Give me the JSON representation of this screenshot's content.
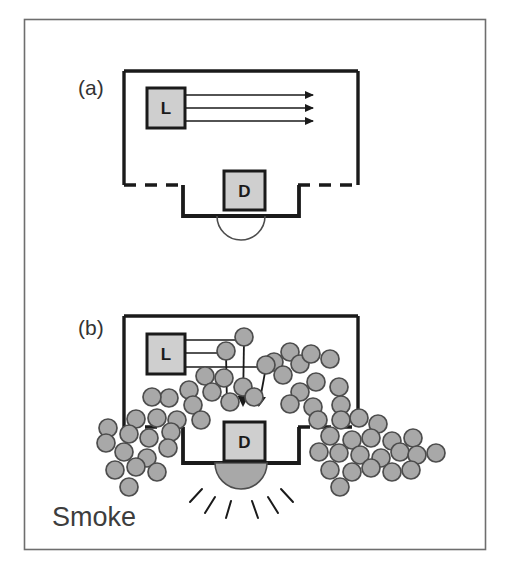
{
  "figure": {
    "caption_panels": [
      {
        "id": "a",
        "label": "(a)",
        "x": 78,
        "y": 88
      },
      {
        "id": "b",
        "label": "(b)",
        "x": 78,
        "y": 328
      }
    ],
    "annotations": {
      "smoke_label": "Smoke",
      "smoke_label_x": 52,
      "smoke_label_y": 526
    },
    "colors": {
      "frame_stroke": "#6e6e6e",
      "chamber_stroke": "#1a1a1a",
      "box_fill": "#cfcfcf",
      "box_stroke": "#1a1a1a",
      "particle_fill": "#a8a8a8",
      "particle_stroke": "#4d4d4d",
      "beam_stroke": "#1a1a1a",
      "dome_fill": "#a8a8a8",
      "dome_stroke": "#1a1a1a",
      "ray_stroke": "#1a1a1a",
      "background": "#ffffff",
      "text": "#333333"
    },
    "outer_frame": {
      "x": 24,
      "y": 19,
      "width": 461,
      "height": 530
    },
    "panel_a": {
      "chamber": {
        "solid_top": "M 124 71 L 358 71",
        "left_wall": "M 124 71 L 124 185",
        "right_wall": "M 358 71 L 358 185",
        "dashed_left": "M 124 185 L 182 185",
        "dashed_right": "M 300 185 L 358 185",
        "well": "M 182 185 L 182 216 L 300 216 L 300 185"
      },
      "source_box": {
        "x": 147,
        "y": 88,
        "width": 38,
        "height": 40,
        "letter": "L"
      },
      "detector_box": {
        "x": 224,
        "y": 171,
        "width": 41,
        "height": 39,
        "letter": "D"
      },
      "dome": {
        "cx": 241,
        "cy": 216,
        "r": 24,
        "filled": false
      },
      "beams": [
        {
          "x1": 186,
          "y1": 95,
          "x2": 313,
          "y2": 95
        },
        {
          "x1": 186,
          "y1": 108,
          "x2": 313,
          "y2": 108
        },
        {
          "x1": 186,
          "y1": 121,
          "x2": 313,
          "y2": 121
        }
      ]
    },
    "panel_b": {
      "chamber": {
        "solid_top": "M 124 316 L 358 316",
        "left_wall": "M 124 316 L 124 427",
        "right_wall": "M 358 316 L 358 427",
        "dashed_left": "M 124 427 L 182 427",
        "dashed_right": "M 300 427 L 358 427",
        "well": "M 182 427 L 182 463 L 300 463 L 300 427"
      },
      "source_box": {
        "x": 147,
        "y": 334,
        "width": 38,
        "height": 40,
        "letter": "L"
      },
      "detector_box": {
        "x": 224,
        "y": 422,
        "width": 41,
        "height": 39,
        "letter": "D"
      },
      "dome": {
        "cx": 241,
        "cy": 463,
        "r": 26,
        "filled": true
      },
      "alarm_rays": [
        {
          "x1": 202,
          "y1": 489,
          "x2": 190,
          "y2": 502
        },
        {
          "x1": 215,
          "y1": 497,
          "x2": 205,
          "y2": 513
        },
        {
          "x1": 231,
          "y1": 501,
          "x2": 226,
          "y2": 518
        },
        {
          "x1": 252,
          "y1": 501,
          "x2": 258,
          "y2": 518
        },
        {
          "x1": 268,
          "y1": 497,
          "x2": 278,
          "y2": 513
        },
        {
          "x1": 281,
          "y1": 489,
          "x2": 293,
          "y2": 502
        }
      ],
      "scatter_paths": [
        {
          "from_x": 186,
          "from_y": 340,
          "hit_x": 244,
          "hit_y": 340,
          "to_x": 243,
          "to_y": 412
        },
        {
          "from_x": 186,
          "from_y": 353,
          "hit_x": 226,
          "hit_y": 353,
          "to_x": 227,
          "to_y": 412
        },
        {
          "from_x": 186,
          "from_y": 367,
          "hit_x": 266,
          "hit_y": 367,
          "to_x": 259,
          "to_y": 412
        }
      ],
      "beam_particles": [
        {
          "cx": 244,
          "cy": 337,
          "r": 9
        },
        {
          "cx": 226,
          "cy": 351,
          "r": 9
        },
        {
          "cx": 266,
          "cy": 365,
          "r": 9
        }
      ],
      "smoke_particles": [
        {
          "cx": 205,
          "cy": 376,
          "r": 9
        },
        {
          "cx": 224,
          "cy": 378,
          "r": 9
        },
        {
          "cx": 274,
          "cy": 362,
          "r": 9
        },
        {
          "cx": 283,
          "cy": 375,
          "r": 9
        },
        {
          "cx": 290,
          "cy": 352,
          "r": 9
        },
        {
          "cx": 300,
          "cy": 364,
          "r": 9
        },
        {
          "cx": 311,
          "cy": 354,
          "r": 9
        },
        {
          "cx": 330,
          "cy": 359,
          "r": 9
        },
        {
          "cx": 189,
          "cy": 390,
          "r": 9
        },
        {
          "cx": 212,
          "cy": 392,
          "r": 9
        },
        {
          "cx": 243,
          "cy": 387,
          "r": 9
        },
        {
          "cx": 169,
          "cy": 398,
          "r": 9
        },
        {
          "cx": 152,
          "cy": 397,
          "r": 9
        },
        {
          "cx": 193,
          "cy": 405,
          "r": 9
        },
        {
          "cx": 230,
          "cy": 402,
          "r": 9
        },
        {
          "cx": 254,
          "cy": 397,
          "r": 9
        },
        {
          "cx": 316,
          "cy": 382,
          "r": 9
        },
        {
          "cx": 339,
          "cy": 387,
          "r": 9
        },
        {
          "cx": 300,
          "cy": 392,
          "r": 9
        },
        {
          "cx": 290,
          "cy": 404,
          "r": 9
        },
        {
          "cx": 313,
          "cy": 407,
          "r": 9
        },
        {
          "cx": 341,
          "cy": 405,
          "r": 9
        },
        {
          "cx": 136,
          "cy": 419,
          "r": 9
        },
        {
          "cx": 157,
          "cy": 418,
          "r": 9
        },
        {
          "cx": 177,
          "cy": 420,
          "r": 9
        },
        {
          "cx": 201,
          "cy": 420,
          "r": 9
        },
        {
          "cx": 108,
          "cy": 428,
          "r": 9
        },
        {
          "cx": 129,
          "cy": 434,
          "r": 9
        },
        {
          "cx": 149,
          "cy": 438,
          "r": 9
        },
        {
          "cx": 171,
          "cy": 432,
          "r": 9
        },
        {
          "cx": 318,
          "cy": 420,
          "r": 9
        },
        {
          "cx": 341,
          "cy": 420,
          "r": 9
        },
        {
          "cx": 359,
          "cy": 418,
          "r": 9
        },
        {
          "cx": 378,
          "cy": 424,
          "r": 9
        },
        {
          "cx": 330,
          "cy": 436,
          "r": 9
        },
        {
          "cx": 352,
          "cy": 440,
          "r": 9
        },
        {
          "cx": 371,
          "cy": 438,
          "r": 9
        },
        {
          "cx": 392,
          "cy": 441,
          "r": 9
        },
        {
          "cx": 413,
          "cy": 438,
          "r": 9
        },
        {
          "cx": 106,
          "cy": 443,
          "r": 9
        },
        {
          "cx": 124,
          "cy": 452,
          "r": 9
        },
        {
          "cx": 147,
          "cy": 458,
          "r": 9
        },
        {
          "cx": 168,
          "cy": 448,
          "r": 9
        },
        {
          "cx": 319,
          "cy": 452,
          "r": 9
        },
        {
          "cx": 339,
          "cy": 453,
          "r": 9
        },
        {
          "cx": 360,
          "cy": 455,
          "r": 9
        },
        {
          "cx": 381,
          "cy": 458,
          "r": 9
        },
        {
          "cx": 400,
          "cy": 452,
          "r": 9
        },
        {
          "cx": 417,
          "cy": 455,
          "r": 9
        },
        {
          "cx": 436,
          "cy": 453,
          "r": 9
        },
        {
          "cx": 115,
          "cy": 470,
          "r": 9
        },
        {
          "cx": 136,
          "cy": 467,
          "r": 9
        },
        {
          "cx": 157,
          "cy": 472,
          "r": 9
        },
        {
          "cx": 330,
          "cy": 470,
          "r": 9
        },
        {
          "cx": 352,
          "cy": 472,
          "r": 9
        },
        {
          "cx": 371,
          "cy": 468,
          "r": 9
        },
        {
          "cx": 392,
          "cy": 472,
          "r": 9
        },
        {
          "cx": 411,
          "cy": 470,
          "r": 9
        },
        {
          "cx": 129,
          "cy": 487,
          "r": 9
        },
        {
          "cx": 340,
          "cy": 487,
          "r": 9
        }
      ]
    }
  }
}
